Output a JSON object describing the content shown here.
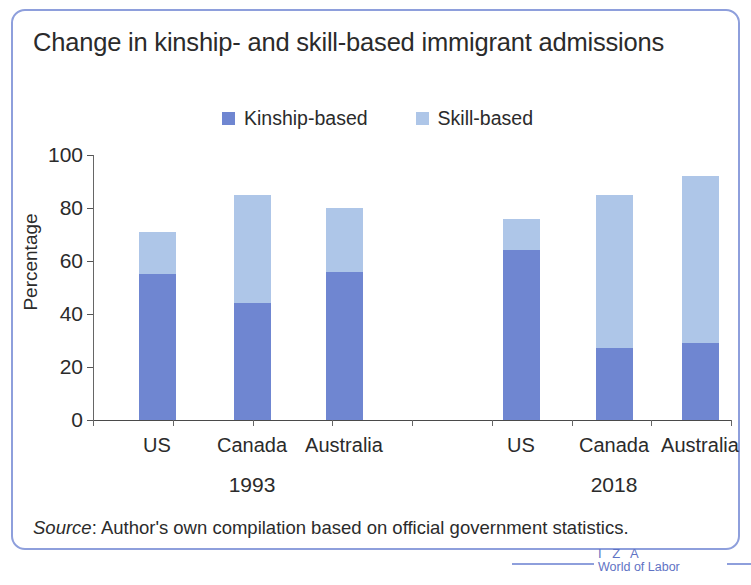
{
  "figure": {
    "title": "Change in kinship- and skill-based immigrant admissions",
    "source_prefix": "Source",
    "source_separator": ": ",
    "source_text": "Author's own compilation based on official government statistics."
  },
  "brand": {
    "line1": "I Z A",
    "line2": "World of Labor",
    "color": "#5f73c4"
  },
  "colors": {
    "kinship": "#6f86d1",
    "skill": "#aec6e8",
    "border": "#8e9fdc",
    "text": "#2b2b2b",
    "axis": "#4a4a4a"
  },
  "chart_data": {
    "type": "bar",
    "title": "Change in kinship- and skill-based immigrant admissions",
    "xlabel": "",
    "ylabel": "Percentage",
    "ylim": [
      0,
      100
    ],
    "yticks": [
      0,
      20,
      40,
      60,
      80,
      100
    ],
    "grid": false,
    "stacked": true,
    "legend_position": "top-center",
    "groups": [
      "1993",
      "2018"
    ],
    "categories": [
      "US",
      "Canada",
      "Australia",
      "US",
      "Canada",
      "Australia"
    ],
    "series": [
      {
        "name": "Kinship-based",
        "color": "#6f86d1",
        "values": [
          55,
          44,
          56,
          64,
          27,
          29
        ]
      },
      {
        "name": "Skill-based",
        "color": "#aec6e8",
        "values": [
          16,
          41,
          24,
          12,
          58,
          63
        ]
      }
    ],
    "totals": [
      71,
      85,
      80,
      76,
      85,
      92
    ],
    "bars": [
      {
        "group": "1993",
        "category": "US",
        "kinship": 55,
        "skill": 16,
        "total": 71,
        "x": 144
      },
      {
        "group": "1993",
        "category": "Canada",
        "kinship": 44,
        "skill": 41,
        "total": 85,
        "x": 239
      },
      {
        "group": "1993",
        "category": "Australia",
        "kinship": 56,
        "skill": 24,
        "total": 80,
        "x": 331
      },
      {
        "group": "2018",
        "category": "US",
        "kinship": 64,
        "skill": 12,
        "total": 76,
        "x": 508
      },
      {
        "group": "2018",
        "category": "Canada",
        "kinship": 27,
        "skill": 58,
        "total": 85,
        "x": 601
      },
      {
        "group": "2018",
        "category": "Australia",
        "kinship": 29,
        "skill": 63,
        "total": 92,
        "x": 687
      }
    ],
    "group_label_positions": [
      {
        "label": "1993",
        "x": 239
      },
      {
        "label": "2018",
        "x": 601
      }
    ]
  }
}
